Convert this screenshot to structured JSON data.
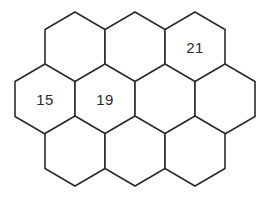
{
  "figure": {
    "name": "hexagon-honeycomb-grid",
    "type": "diagram",
    "background_color": "#ffffff",
    "stroke_color": "#2b2b2b",
    "label_color": "#2b2b2b",
    "orientation": "pointy-top",
    "hex_width": 60,
    "hex_height": 70,
    "row_vertical_step": 52,
    "rows": [
      {
        "row_index": 0,
        "cell_count": 3
      },
      {
        "row_index": 1,
        "cell_count": 4
      },
      {
        "row_index": 2,
        "cell_count": 3
      }
    ],
    "cells": [
      {
        "id": "r0c0",
        "row": 0,
        "col": 0,
        "cx": 75,
        "cy": 47,
        "label": ""
      },
      {
        "id": "r0c1",
        "row": 0,
        "col": 1,
        "cx": 135,
        "cy": 47,
        "label": ""
      },
      {
        "id": "r0c2",
        "row": 0,
        "col": 2,
        "cx": 195,
        "cy": 47,
        "label": "21"
      },
      {
        "id": "r1c0",
        "row": 1,
        "col": 0,
        "cx": 45,
        "cy": 99,
        "label": "15"
      },
      {
        "id": "r1c1",
        "row": 1,
        "col": 1,
        "cx": 105,
        "cy": 99,
        "label": "19"
      },
      {
        "id": "r1c2",
        "row": 1,
        "col": 2,
        "cx": 165,
        "cy": 99,
        "label": ""
      },
      {
        "id": "r1c3",
        "row": 1,
        "col": 3,
        "cx": 225,
        "cy": 99,
        "label": ""
      },
      {
        "id": "r2c0",
        "row": 2,
        "col": 0,
        "cx": 75,
        "cy": 151,
        "label": ""
      },
      {
        "id": "r2c1",
        "row": 2,
        "col": 1,
        "cx": 135,
        "cy": 151,
        "label": ""
      },
      {
        "id": "r2c2",
        "row": 2,
        "col": 2,
        "cx": 195,
        "cy": 151,
        "label": ""
      }
    ],
    "labels": [
      {
        "text": "21",
        "cell": "r0c2"
      },
      {
        "text": "15",
        "cell": "r1c0"
      },
      {
        "text": "19",
        "cell": "r1c1"
      }
    ]
  }
}
